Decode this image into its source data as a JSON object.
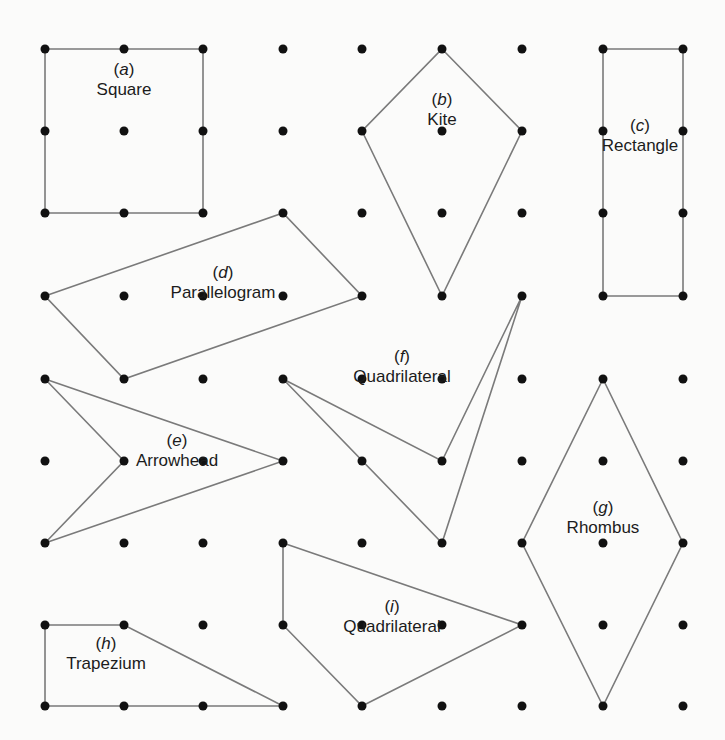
{
  "grid": {
    "cols": [
      45,
      124,
      203,
      283,
      362,
      442,
      522,
      603,
      683
    ],
    "rows": [
      49,
      131,
      213,
      296,
      379,
      461,
      543,
      625,
      706
    ],
    "dot_color": "#111111",
    "dot_radius": 4.5
  },
  "line_color": "#7a7a7a",
  "shapes": [
    {
      "id": "a",
      "tag": "a",
      "name": "Square",
      "points": [
        [
          0,
          0
        ],
        [
          2,
          0
        ],
        [
          2,
          2
        ],
        [
          0,
          2
        ]
      ],
      "label_pos": [
        124,
        70
      ]
    },
    {
      "id": "b",
      "tag": "b",
      "name": "Kite",
      "points": [
        [
          5,
          0
        ],
        [
          6,
          1
        ],
        [
          5,
          3
        ],
        [
          4,
          1
        ]
      ],
      "label_pos": [
        442,
        100
      ]
    },
    {
      "id": "c",
      "tag": "c",
      "name": "Rectangle",
      "points": [
        [
          7,
          0
        ],
        [
          8,
          0
        ],
        [
          8,
          3
        ],
        [
          7,
          3
        ]
      ],
      "label_pos": [
        640,
        126
      ]
    },
    {
      "id": "d",
      "tag": "d",
      "name": "Parallelogram",
      "points": [
        [
          0,
          3
        ],
        [
          3,
          2
        ],
        [
          4,
          3
        ],
        [
          1,
          4
        ]
      ],
      "label_pos": [
        223,
        273
      ]
    },
    {
      "id": "e",
      "tag": "e",
      "name": "Arrowhead",
      "points": [
        [
          0,
          4
        ],
        [
          3,
          5
        ],
        [
          0,
          6
        ],
        [
          1,
          5
        ]
      ],
      "label_pos": [
        177,
        441
      ]
    },
    {
      "id": "f",
      "tag": "f",
      "name": "Quadrilateral",
      "points": [
        [
          3,
          4
        ],
        [
          5,
          5
        ],
        [
          6,
          3
        ],
        [
          5,
          6
        ]
      ],
      "label_pos": [
        402,
        357
      ]
    },
    {
      "id": "g",
      "tag": "g",
      "name": "Rhombus",
      "points": [
        [
          7,
          4
        ],
        [
          8,
          6
        ],
        [
          7,
          8
        ],
        [
          6,
          6
        ]
      ],
      "label_pos": [
        603,
        508
      ]
    },
    {
      "id": "h",
      "tag": "h",
      "name": "Trapezium",
      "points": [
        [
          0,
          7
        ],
        [
          1,
          7
        ],
        [
          3,
          8
        ],
        [
          0,
          8
        ]
      ],
      "label_pos": [
        106,
        644
      ]
    },
    {
      "id": "i",
      "tag": "i",
      "name": "Quadrilateral",
      "points": [
        [
          3,
          6
        ],
        [
          6,
          7
        ],
        [
          4,
          8
        ],
        [
          3,
          7
        ]
      ],
      "label_pos": [
        392,
        607
      ]
    }
  ]
}
